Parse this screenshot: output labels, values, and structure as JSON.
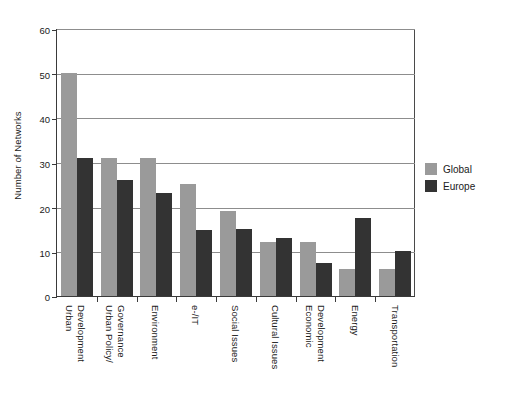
{
  "chart_data": {
    "type": "bar",
    "title": "",
    "xlabel": "",
    "ylabel": "Number of Networks",
    "ylim": [
      0,
      60
    ],
    "yticks": [
      0,
      10,
      20,
      30,
      40,
      50,
      60
    ],
    "grid": true,
    "legend_position": "right",
    "categories": [
      "Urban Development",
      "Urban Policy/ Governance",
      "Environment",
      "e-/IT",
      "Social Issues",
      "Cultural Issues",
      "Economic Development",
      "Energy",
      "Transportation"
    ],
    "category_lines": [
      [
        "Urban",
        "Development"
      ],
      [
        "Urban Policy/",
        "Governance"
      ],
      [
        "Environment"
      ],
      [
        "e-/IT"
      ],
      [
        "Social Issues"
      ],
      [
        "Cultural Issues"
      ],
      [
        "Economic",
        "Development"
      ],
      [
        "Energy"
      ],
      [
        "Transportation"
      ]
    ],
    "series": [
      {
        "name": "Global",
        "color": "#9a9a9a",
        "values": [
          50,
          31,
          31,
          25,
          19,
          12,
          12,
          6,
          6
        ]
      },
      {
        "name": "Europe",
        "color": "#333333",
        "values": [
          31,
          26,
          23,
          14.8,
          15,
          13,
          7.5,
          17.5,
          10
        ]
      }
    ]
  },
  "axis": {
    "y_title": "Number of Networks",
    "tick_60": "60",
    "tick_50": "50",
    "tick_40": "40",
    "tick_30": "30",
    "tick_20": "20",
    "tick_10": "10",
    "tick_0": "0"
  },
  "legend": {
    "items": [
      {
        "label": "Global",
        "color": "#9a9a9a"
      },
      {
        "label": "Europe",
        "color": "#333333"
      }
    ]
  }
}
